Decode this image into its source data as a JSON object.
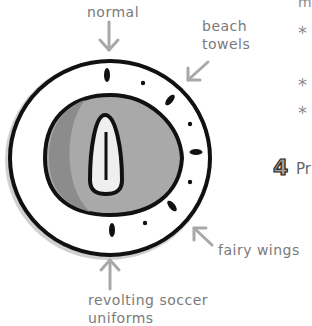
{
  "labels": {
    "normal": "normal",
    "beach_line1": "beach",
    "beach_line2": "towels",
    "fairy": "fairy wings",
    "revolting_line1": "revolting soccer",
    "revolting_line2": "uniforms"
  },
  "side_text": {
    "top_fragment": "m",
    "bullets": [
      "*",
      "*",
      "*"
    ],
    "step_number": "4",
    "step_fragment": "Pr"
  },
  "colors": {
    "label_gray": "#7a7a7a",
    "arrow_gray": "#a8a8a8",
    "outline": "#111111",
    "knob_gray": "#a9a9a9",
    "knob_shadow": "#8c8c8c",
    "ring_shadow": "#d0d0d0"
  }
}
